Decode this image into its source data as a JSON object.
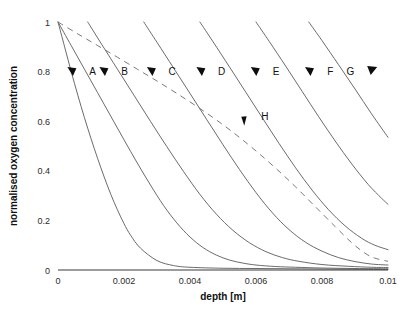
{
  "chart_data": {
    "type": "line",
    "title": "",
    "xlabel": "depth [m]",
    "ylabel": "normalised oxygen concentration",
    "xlim": [
      0,
      0.01
    ],
    "ylim": [
      0,
      1
    ],
    "xticks": [
      "0",
      "0.002",
      "0.004",
      "0.006",
      "0.008",
      "0.01"
    ],
    "xtick_values": [
      0,
      0.002,
      0.004,
      0.006,
      0.008,
      0.01
    ],
    "yticks": [
      "0",
      "0.2",
      "0.4",
      "0.6",
      "0.8",
      "1"
    ],
    "ytick_values": [
      0,
      0.2,
      0.4,
      0.6,
      0.8,
      1
    ],
    "grid": false,
    "legend": "inline-labels-with-arrows",
    "line_color": "#5a5a5a",
    "dashed_color": "#6a6a6a",
    "series": [
      {
        "name": "A",
        "style": "solid",
        "x": [
          0,
          0.0002,
          0.0004,
          0.0006,
          0.0008,
          0.001,
          0.0012,
          0.0014,
          0.0016,
          0.0018,
          0.002,
          0.0022,
          0.0025,
          0.003,
          0.0035,
          0.004,
          0.005,
          0.006,
          0.007,
          0.008,
          0.009,
          0.01
        ],
        "y": [
          1.0,
          0.9,
          0.8,
          0.705,
          0.615,
          0.53,
          0.45,
          0.375,
          0.305,
          0.243,
          0.187,
          0.14,
          0.088,
          0.038,
          0.018,
          0.011,
          0.007,
          0.006,
          0.005,
          0.004,
          0.003,
          0.002
        ]
      },
      {
        "name": "B",
        "style": "solid",
        "x": [
          0,
          0.0004,
          0.0008,
          0.0012,
          0.0016,
          0.002,
          0.0024,
          0.0028,
          0.0032,
          0.0036,
          0.004,
          0.0044,
          0.0048,
          0.0052,
          0.0056,
          0.006,
          0.0066,
          0.0072,
          0.008,
          0.009,
          0.01
        ],
        "y": [
          1.0,
          0.905,
          0.81,
          0.715,
          0.62,
          0.525,
          0.432,
          0.343,
          0.26,
          0.19,
          0.133,
          0.09,
          0.06,
          0.04,
          0.028,
          0.02,
          0.014,
          0.011,
          0.008,
          0.006,
          0.005
        ]
      },
      {
        "name": "C",
        "style": "solid",
        "x": [
          0.0009,
          0.0013,
          0.0018,
          0.0023,
          0.0028,
          0.0033,
          0.0038,
          0.0043,
          0.0048,
          0.0053,
          0.0058,
          0.0063,
          0.0068,
          0.0073,
          0.008,
          0.0088,
          0.0095,
          0.01
        ],
        "y": [
          1.0,
          0.915,
          0.81,
          0.705,
          0.6,
          0.497,
          0.398,
          0.305,
          0.225,
          0.16,
          0.11,
          0.074,
          0.05,
          0.035,
          0.022,
          0.015,
          0.011,
          0.01
        ]
      },
      {
        "name": "D",
        "style": "solid",
        "x": [
          0.0026,
          0.003,
          0.0035,
          0.004,
          0.0045,
          0.005,
          0.0055,
          0.006,
          0.0065,
          0.007,
          0.0075,
          0.008,
          0.0085,
          0.009,
          0.0095,
          0.01
        ],
        "y": [
          1.0,
          0.918,
          0.815,
          0.712,
          0.608,
          0.505,
          0.405,
          0.312,
          0.23,
          0.163,
          0.112,
          0.076,
          0.05,
          0.034,
          0.024,
          0.02
        ]
      },
      {
        "name": "E",
        "style": "solid",
        "x": [
          0.0043,
          0.0047,
          0.0052,
          0.0057,
          0.0062,
          0.0067,
          0.0072,
          0.0077,
          0.0082,
          0.0087,
          0.0092,
          0.0096,
          0.01
        ],
        "y": [
          1.0,
          0.92,
          0.818,
          0.715,
          0.612,
          0.51,
          0.412,
          0.322,
          0.243,
          0.178,
          0.128,
          0.1,
          0.082
        ]
      },
      {
        "name": "F",
        "style": "solid",
        "x": [
          0.006,
          0.0064,
          0.0069,
          0.0074,
          0.0079,
          0.0084,
          0.0089,
          0.0094,
          0.0098,
          0.01
        ],
        "y": [
          1.0,
          0.922,
          0.822,
          0.72,
          0.618,
          0.52,
          0.428,
          0.345,
          0.29,
          0.265
        ]
      },
      {
        "name": "G",
        "style": "solid",
        "x": [
          0.0076,
          0.008,
          0.0085,
          0.009,
          0.0095,
          0.01
        ],
        "y": [
          1.0,
          0.925,
          0.828,
          0.73,
          0.63,
          0.535
        ]
      },
      {
        "name": "H",
        "style": "dashed",
        "x": [
          0,
          0.0006,
          0.0012,
          0.0018,
          0.0024,
          0.003,
          0.0036,
          0.0042,
          0.0048,
          0.0054,
          0.006,
          0.0066,
          0.0072,
          0.0078,
          0.0084,
          0.0089,
          0.0093,
          0.0096,
          0.01
        ],
        "y": [
          1.0,
          0.952,
          0.905,
          0.858,
          0.81,
          0.762,
          0.712,
          0.66,
          0.605,
          0.545,
          0.48,
          0.41,
          0.335,
          0.255,
          0.175,
          0.11,
          0.068,
          0.048,
          0.035
        ]
      }
    ],
    "annotations": [
      {
        "label": "A",
        "pointer_x": 0.00042,
        "pointer_y": 0.8,
        "label_x": 0.00105,
        "label_y": 0.8,
        "pointer_side": "left"
      },
      {
        "label": "B",
        "pointer_x": 0.00139,
        "pointer_y": 0.8,
        "label_x": 0.00202,
        "label_y": 0.8,
        "pointer_side": "left"
      },
      {
        "label": "C",
        "pointer_x": 0.00283,
        "pointer_y": 0.8,
        "label_x": 0.00346,
        "label_y": 0.8,
        "pointer_side": "left"
      },
      {
        "label": "D",
        "pointer_x": 0.00433,
        "pointer_y": 0.8,
        "label_x": 0.00496,
        "label_y": 0.8,
        "pointer_side": "left"
      },
      {
        "label": "E",
        "pointer_x": 0.00598,
        "pointer_y": 0.8,
        "label_x": 0.00661,
        "label_y": 0.8,
        "pointer_side": "left"
      },
      {
        "label": "F",
        "pointer_x": 0.00762,
        "pointer_y": 0.8,
        "label_x": 0.00825,
        "label_y": 0.8,
        "pointer_side": "left"
      },
      {
        "label": "G",
        "pointer_x": 0.00952,
        "pointer_y": 0.805,
        "label_x": 0.00886,
        "label_y": 0.8,
        "pointer_side": "right"
      },
      {
        "label": "H",
        "pointer_x": 0.00563,
        "pointer_y": 0.598,
        "label_x": 0.00627,
        "label_y": 0.618,
        "pointer_side": "left"
      }
    ]
  }
}
